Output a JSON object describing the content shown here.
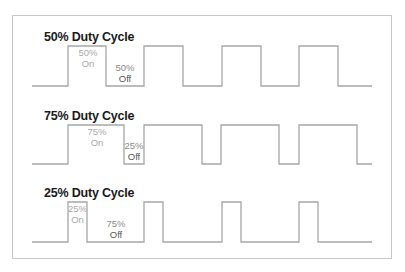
{
  "diagram": {
    "colors": {
      "wave": "#a6a6a6",
      "frame": "#c8c8c8",
      "title": "#1a1a1a",
      "on_label": "#a9a9a9",
      "off_label": "#8a8a8a"
    },
    "panels": [
      {
        "title": "50% Duty Cycle",
        "on_pct": "50%",
        "on_word": "On",
        "off_pct": "50%",
        "off_word": "Off",
        "duty": 0.5
      },
      {
        "title": "75% Duty Cycle",
        "on_pct": "75%",
        "on_word": "On",
        "off_pct": "25%",
        "off_word": "Off",
        "duty": 0.75
      },
      {
        "title": "25% Duty Cycle",
        "on_pct": "25%",
        "on_word": "On",
        "off_pct": "75%",
        "off_word": "Off",
        "duty": 0.25
      }
    ],
    "waveforms": [
      {
        "name": "50-percent",
        "points": "32,86 68,86 68,46 106,46 106,86 144,86 144,46 183,46 183,86 222,86 222,46 261,46 261,86 299,86 299,46 338,46 338,86 372,86"
      },
      {
        "name": "75-percent",
        "points": "32,164 68,164 68,125 124,125 124,164 144,164 144,125 202,125 202,164 221,164 221,125 279,125 279,164 299,164 299,125 357,125 357,164 372,164"
      },
      {
        "name": "25-percent",
        "points": "32,242 68,242 68,202 87,202 87,242 144,242 144,202 163,202 163,242 222,242 222,202 241,202 241,242 299,242 299,202 318,202 318,242 372,242"
      }
    ]
  }
}
